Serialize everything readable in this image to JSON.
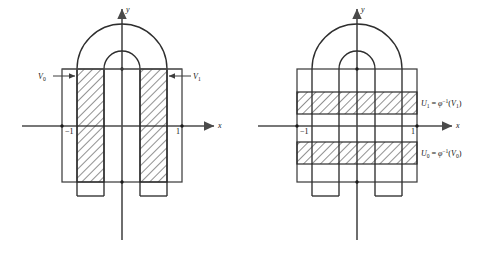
{
  "figure": {
    "panels": [
      {
        "id": "left",
        "name": "target-panel",
        "axis": {
          "x_label": "x",
          "y_label": "y"
        },
        "ticks": [
          {
            "label": "−1",
            "value": -1
          },
          {
            "label": "1",
            "value": 1
          }
        ],
        "region_labels": [
          {
            "id": "V0",
            "text": "V",
            "subscript": "0",
            "arrow": "right"
          },
          {
            "id": "V1",
            "text": "V",
            "subscript": "1",
            "arrow": "left"
          }
        ],
        "hatch_orientation": "vertical-strips",
        "strip_count": 2
      },
      {
        "id": "right",
        "name": "preimage-panel",
        "axis": {
          "x_label": "x",
          "y_label": "y"
        },
        "ticks": [
          {
            "label": "−1",
            "value": -1
          },
          {
            "label": "1",
            "value": 1
          }
        ],
        "region_labels": [
          {
            "id": "U1",
            "lhs": "U",
            "lhs_sub": "1",
            "eq": "=",
            "phi": "φ",
            "exp": "−1",
            "arg_open": "(",
            "arg": "V",
            "arg_sub": "1",
            "arg_close": ")"
          },
          {
            "id": "U0",
            "lhs": "U",
            "lhs_sub": "0",
            "eq": "=",
            "phi": "φ",
            "exp": "−1",
            "arg_open": "(",
            "arg": "V",
            "arg_sub": "0",
            "arg_close": ")"
          }
        ],
        "hatch_orientation": "horizontal-bands",
        "band_count": 2
      }
    ],
    "colors": {
      "stroke": "#3d3d3d",
      "axis": "#4a4a4a",
      "hatch": "#2b2b2b",
      "background": "#ffffff"
    }
  }
}
